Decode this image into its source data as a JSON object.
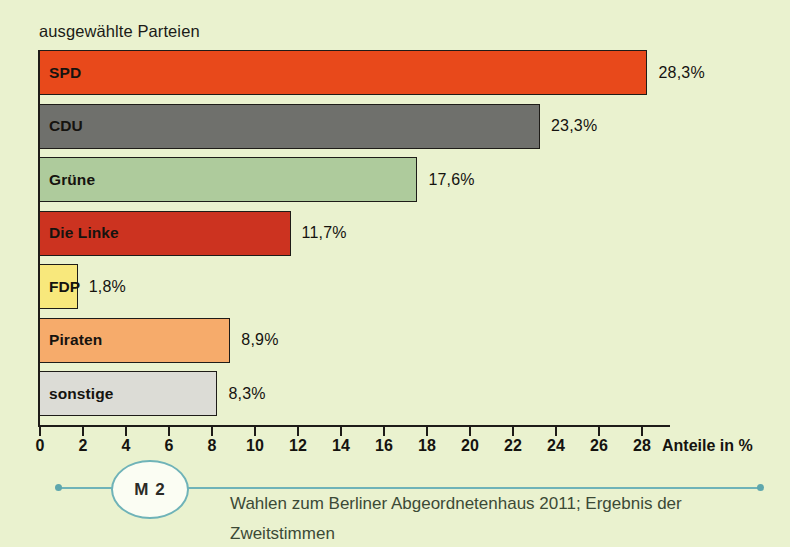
{
  "chart_data": {
    "type": "bar",
    "orientation": "horizontal",
    "title": "ausgewählte Parteien",
    "xlabel": "Anteile in %",
    "ylabel": "",
    "xlim": [
      0,
      28
    ],
    "xticks": [
      0,
      2,
      4,
      6,
      8,
      10,
      12,
      14,
      16,
      18,
      20,
      22,
      24,
      26,
      28
    ],
    "xtick_labels": [
      "0",
      "2",
      "4",
      "6",
      "8",
      "10",
      "12",
      "14",
      "16",
      "18",
      "20",
      "22",
      "24",
      "26",
      "28"
    ],
    "grid": false,
    "legend": false,
    "categories": [
      "SPD",
      "CDU",
      "Grüne",
      "Die Linke",
      "FDP",
      "Piraten",
      "sonstige"
    ],
    "values": [
      28.3,
      23.3,
      17.6,
      11.7,
      1.8,
      8.9,
      8.3
    ],
    "value_labels": [
      "28,3%",
      "23,3%",
      "17,6%",
      "11,7%",
      "1,8%",
      "8,9%",
      "8,3%"
    ],
    "bar_colors": [
      "#e8491b",
      "#6f706c",
      "#aecb9c",
      "#cc3320",
      "#f8e87c",
      "#f6ab6b",
      "#dcdcd6"
    ],
    "bars": [
      {
        "label": "SPD",
        "value": 28.3,
        "value_label": "28,3%",
        "color": "#e8491b"
      },
      {
        "label": "CDU",
        "value": 23.3,
        "value_label": "23,3%",
        "color": "#6f706c"
      },
      {
        "label": "Grüne",
        "value": 17.6,
        "value_label": "17,6%",
        "color": "#aecb9c"
      },
      {
        "label": "Die Linke",
        "value": 11.7,
        "value_label": "11,7%",
        "color": "#cc3320"
      },
      {
        "label": "FDP",
        "value": 1.8,
        "value_label": "1,8%",
        "color": "#f8e87c"
      },
      {
        "label": "Piraten",
        "value": 8.9,
        "value_label": "8,9%",
        "color": "#f6ab6b"
      },
      {
        "label": "sonstige",
        "value": 8.3,
        "value_label": "8,3%",
        "color": "#dcdcd6"
      }
    ]
  },
  "footer": {
    "badge": "M 2",
    "caption": "Wahlen zum Berliner Abgeordnetenhaus 2011; Ergebnis der Zweitstimmen"
  },
  "colors": {
    "background": "#eaf2cf",
    "axis": "#1e1c18",
    "accent_line": "#6fb3b8",
    "caption_text": "#3c4a36"
  }
}
